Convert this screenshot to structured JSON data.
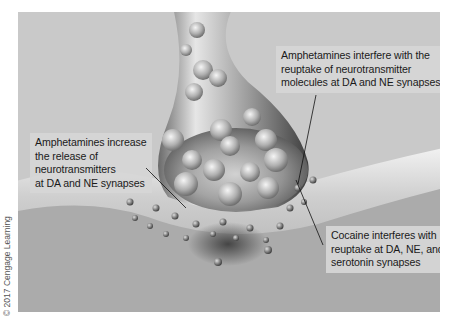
{
  "figure": {
    "colors": {
      "background": "#ffffff",
      "panel": "#c9c9c9",
      "postsynaptic": "#a9a9a9",
      "terminal": "#8c8c8c",
      "callout_bg": "#d6d6d6",
      "text": "#1a1a1a"
    }
  },
  "callouts": {
    "reuptake": {
      "lines": [
        "Amphetamines interfere with the",
        "reuptake of neurotransmitter",
        "molecules at DA and NE synapses"
      ]
    },
    "release": {
      "lines": [
        "Amphetamines increase",
        "the release of",
        "neurotransmitters",
        "at DA and NE synapses"
      ]
    },
    "cocaine": {
      "lines": [
        "Cocaine interferes with",
        "reuptake at DA, NE, and",
        "serotonin synapses"
      ]
    }
  },
  "credit": "© 2017 Cengage Learning"
}
